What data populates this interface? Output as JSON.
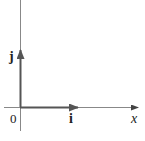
{
  "diagram": {
    "axes": {
      "origin_label": "0",
      "x_axis_label": "x"
    },
    "vectors": [
      {
        "name": "i",
        "label": "i",
        "direction": "x"
      },
      {
        "name": "j",
        "label": "j",
        "direction": "y"
      }
    ],
    "colors": {
      "axis": "#777777",
      "vector": "#555555",
      "background": "#ffffff"
    }
  }
}
